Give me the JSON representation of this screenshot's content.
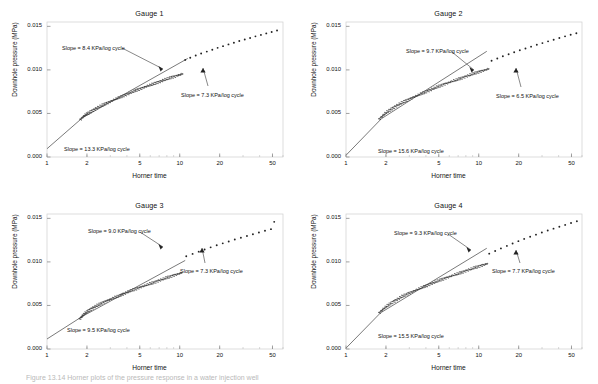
{
  "figure": {
    "caption": "Figure 13.14  Horner plots of the pressure response in a water injection well",
    "axis": {
      "xlabel": "Horner time",
      "ylabel": "Downhole pressure (MPa)",
      "xticks": [
        "1",
        "2",
        "5",
        "10",
        "20",
        "50"
      ],
      "yticks": [
        "0.000",
        "0.005",
        "0.010",
        "0.015"
      ]
    }
  },
  "chart_data": [
    {
      "type": "scatter",
      "title": "Gauge 1",
      "xlabel": "Horner time",
      "ylabel": "Downhole pressure (MPa)",
      "xscale": "log",
      "xlim": [
        1,
        60
      ],
      "ylim": [
        0.0,
        0.0155
      ],
      "xticks": [
        1,
        2,
        5,
        10,
        20,
        50
      ],
      "yticks": [
        0.0,
        0.005,
        0.01,
        0.015
      ],
      "grid": false,
      "legend": "none",
      "annotations": [
        {
          "label": "Slope = 8.4 KPa/log cycle",
          "slope_kpa_per_log_cycle": 8.4,
          "segment": "early-middle"
        },
        {
          "label": "Slope = 7.3 KPa/log cycle",
          "slope_kpa_per_log_cycle": 7.3,
          "segment": "late"
        },
        {
          "label": "Slope = 13.3 KPa/log cycle",
          "slope_kpa_per_log_cycle": 13.3,
          "segment": "earliest"
        }
      ],
      "fit_lines": [
        {
          "name": "early",
          "slope_kpa": 13.3,
          "x": [
            1.0,
            1.85
          ],
          "y": [
            0.00095,
            0.0045
          ]
        },
        {
          "name": "middle",
          "slope_kpa": 8.4,
          "x": [
            1.85,
            11.0
          ],
          "y": [
            0.0045,
            0.01115
          ]
        },
        {
          "name": "late",
          "slope_kpa": 7.3,
          "x": [
            11.0,
            58.0
          ],
          "y": [
            0.01115,
            0.01545
          ]
        }
      ],
      "points": {
        "dense_from": 1.8,
        "dense_to": 10.5,
        "sparse_from": 11.0,
        "sparse_to": 55.0,
        "x": [
          1.8,
          1.85,
          1.9,
          1.95,
          2.0,
          2.05,
          2.12,
          2.2,
          2.28,
          2.36,
          2.45,
          2.55,
          2.65,
          2.75,
          2.86,
          2.97,
          3.09,
          3.21,
          3.34,
          3.47,
          3.61,
          3.75,
          3.9,
          4.06,
          4.22,
          4.39,
          4.56,
          4.74,
          4.93,
          5.13,
          5.33,
          5.54,
          5.76,
          5.99,
          6.23,
          6.48,
          6.74,
          7.01,
          7.29,
          7.58,
          7.88,
          8.19,
          8.52,
          8.86,
          9.21,
          9.58,
          9.96,
          10.35,
          11.0,
          12.0,
          13.2,
          14.5,
          16.0,
          17.6,
          19.3,
          21.2,
          23.3,
          25.6,
          28.1,
          30.9,
          33.9,
          37.2,
          40.9,
          44.9,
          49.3,
          54.1
        ],
        "y": [
          0.00435,
          0.00455,
          0.0047,
          0.00485,
          0.00495,
          0.00505,
          0.0052,
          0.00535,
          0.00548,
          0.0056,
          0.00572,
          0.00585,
          0.00598,
          0.0061,
          0.00622,
          0.00634,
          0.00646,
          0.00658,
          0.0067,
          0.00681,
          0.00692,
          0.00703,
          0.00714,
          0.00725,
          0.00736,
          0.00746,
          0.00757,
          0.00767,
          0.00777,
          0.00787,
          0.00797,
          0.00807,
          0.00817,
          0.00826,
          0.00836,
          0.00845,
          0.00855,
          0.00864,
          0.00873,
          0.00882,
          0.00891,
          0.009,
          0.00909,
          0.00918,
          0.00926,
          0.00935,
          0.00943,
          0.00952,
          0.01115,
          0.0114,
          0.01165,
          0.01188,
          0.0121,
          0.01232,
          0.01253,
          0.01273,
          0.01293,
          0.01312,
          0.01331,
          0.01349,
          0.01367,
          0.01385,
          0.01402,
          0.01419,
          0.01436,
          0.01452
        ]
      }
    },
    {
      "type": "scatter",
      "title": "Gauge 2",
      "xlabel": "Horner time",
      "ylabel": "Downhole pressure (MPa)",
      "xscale": "log",
      "xlim": [
        1,
        60
      ],
      "ylim": [
        0.0,
        0.0155
      ],
      "xticks": [
        1,
        2,
        5,
        10,
        20,
        50
      ],
      "yticks": [
        0.0,
        0.005,
        0.01,
        0.015
      ],
      "grid": false,
      "legend": "none",
      "annotations": [
        {
          "label": "Slope = 9.7 KPa/log cycle",
          "slope_kpa_per_log_cycle": 9.7,
          "segment": "early-middle"
        },
        {
          "label": "Slope = 6.5 KPa/log cycle",
          "slope_kpa_per_log_cycle": 6.5,
          "segment": "late"
        },
        {
          "label": "Slope = 15.6 KPa/log cycle",
          "slope_kpa_per_log_cycle": 15.6,
          "segment": "earliest"
        }
      ],
      "fit_lines": [
        {
          "name": "early",
          "slope_kpa": 15.6,
          "x": [
            1.0,
            1.85
          ],
          "y": [
            0.0002,
            0.0044
          ]
        },
        {
          "name": "middle",
          "slope_kpa": 9.7,
          "x": [
            1.85,
            10.5
          ],
          "y": [
            0.0044,
            0.01175
          ]
        },
        {
          "name": "late",
          "slope_kpa": 6.5,
          "x": [
            10.5,
            58.0
          ],
          "y": [
            0.0108,
            0.0151
          ]
        }
      ],
      "points": {
        "dense_from": 1.8,
        "dense_to": 12.0,
        "sparse_from": 12.5,
        "sparse_to": 55.0,
        "x": [
          1.8,
          1.86,
          1.92,
          1.98,
          2.05,
          2.12,
          2.2,
          2.28,
          2.37,
          2.46,
          2.56,
          2.66,
          2.77,
          2.88,
          3.0,
          3.12,
          3.25,
          3.38,
          3.52,
          3.67,
          3.82,
          3.98,
          4.15,
          4.32,
          4.5,
          4.69,
          4.89,
          5.09,
          5.31,
          5.53,
          5.77,
          6.01,
          6.27,
          6.53,
          6.81,
          7.1,
          7.4,
          7.72,
          8.05,
          8.39,
          8.75,
          9.12,
          9.51,
          9.92,
          10.34,
          10.78,
          11.24,
          11.72,
          12.5,
          13.8,
          15.2,
          16.8,
          18.5,
          20.4,
          22.5,
          24.8,
          27.4,
          30.2,
          33.3,
          36.7,
          40.5,
          44.7,
          49.3,
          54.4
        ],
        "y": [
          0.0044,
          0.00462,
          0.00483,
          0.00502,
          0.0052,
          0.00537,
          0.00553,
          0.00568,
          0.00583,
          0.00597,
          0.00611,
          0.00625,
          0.00638,
          0.00651,
          0.00664,
          0.00677,
          0.00689,
          0.00701,
          0.00713,
          0.00725,
          0.00737,
          0.00748,
          0.0076,
          0.00771,
          0.00782,
          0.00793,
          0.00804,
          0.00815,
          0.00826,
          0.00836,
          0.00847,
          0.00857,
          0.00867,
          0.00877,
          0.00887,
          0.00897,
          0.00907,
          0.00917,
          0.00927,
          0.00936,
          0.00946,
          0.00955,
          0.00965,
          0.00974,
          0.00983,
          0.00992,
          0.01001,
          0.0101,
          0.01105,
          0.01131,
          0.01156,
          0.0118,
          0.01203,
          0.01225,
          0.01246,
          0.01267,
          0.01288,
          0.01308,
          0.01328,
          0.01347,
          0.01366,
          0.01385,
          0.01403,
          0.01421
        ]
      }
    },
    {
      "type": "scatter",
      "title": "Gauge 3",
      "xlabel": "Horner time",
      "ylabel": "Downhole pressure (MPa)",
      "xscale": "log",
      "xlim": [
        1,
        60
      ],
      "ylim": [
        0.0,
        0.0155
      ],
      "xticks": [
        1,
        2,
        5,
        10,
        20,
        50
      ],
      "yticks": [
        0.0,
        0.005,
        0.01,
        0.015
      ],
      "grid": false,
      "legend": "none",
      "annotations": [
        {
          "label": "Slope = 9.0 KPa/log cycle",
          "slope_kpa_per_log_cycle": 9.0,
          "segment": "early-middle"
        },
        {
          "label": "Slope = 7.3 KPa/log cycle",
          "slope_kpa_per_log_cycle": 7.3,
          "segment": "late"
        },
        {
          "label": "Slope = 9.5 KPa/log cycle",
          "slope_kpa_per_log_cycle": 9.5,
          "segment": "earliest"
        }
      ],
      "fit_lines": [
        {
          "name": "early",
          "slope_kpa": 9.5,
          "x": [
            1.0,
            1.85
          ],
          "y": [
            0.00115,
            0.00375
          ]
        },
        {
          "name": "middle",
          "slope_kpa": 9.0,
          "x": [
            1.85,
            10.5
          ],
          "y": [
            0.00375,
            0.01
          ]
        },
        {
          "name": "late",
          "slope_kpa": 7.3,
          "x": [
            10.5,
            58.0
          ],
          "y": [
            0.01035,
            0.0152
          ]
        }
      ],
      "points": {
        "dense_from": 1.8,
        "dense_to": 10.5,
        "sparse_from": 11.0,
        "sparse_to": 52.0,
        "x": [
          1.78,
          1.82,
          1.86,
          1.9,
          1.95,
          2.0,
          2.06,
          2.12,
          2.19,
          2.26,
          2.34,
          2.42,
          2.51,
          2.6,
          2.7,
          2.8,
          2.91,
          3.02,
          3.14,
          3.27,
          3.4,
          3.54,
          3.68,
          3.83,
          3.99,
          4.15,
          4.32,
          4.5,
          4.69,
          4.88,
          5.08,
          5.29,
          5.51,
          5.74,
          5.98,
          6.23,
          6.49,
          6.76,
          7.04,
          7.33,
          7.64,
          7.96,
          8.29,
          8.64,
          9.0,
          9.38,
          9.77,
          10.18,
          11.2,
          12.5,
          13.9,
          15.4,
          17.1,
          19.0,
          21.1,
          23.4,
          26.0,
          28.9,
          32.1,
          35.6,
          39.5,
          43.9,
          48.7,
          51.5
        ],
        "y": [
          0.0035,
          0.00368,
          0.00385,
          0.004,
          0.00415,
          0.00428,
          0.00442,
          0.00455,
          0.00468,
          0.0048,
          0.00492,
          0.00504,
          0.00516,
          0.00528,
          0.00539,
          0.00551,
          0.00562,
          0.00573,
          0.00584,
          0.00595,
          0.00606,
          0.00617,
          0.00628,
          0.00638,
          0.00649,
          0.00659,
          0.0067,
          0.0068,
          0.0069,
          0.007,
          0.0071,
          0.0072,
          0.0073,
          0.0074,
          0.0075,
          0.00759,
          0.00769,
          0.00779,
          0.00788,
          0.00798,
          0.00807,
          0.00817,
          0.00826,
          0.00835,
          0.00845,
          0.00854,
          0.00863,
          0.00872,
          0.01065,
          0.01092,
          0.01118,
          0.01143,
          0.01167,
          0.01191,
          0.01213,
          0.01235,
          0.01257,
          0.01278,
          0.01298,
          0.01318,
          0.01338,
          0.01357,
          0.01376,
          0.0146
        ]
      }
    },
    {
      "type": "scatter",
      "title": "Gauge 4",
      "xlabel": "Horner time",
      "ylabel": "Downhole pressure (MPa)",
      "xscale": "log",
      "xlim": [
        1,
        60
      ],
      "ylim": [
        0.0,
        0.0155
      ],
      "xticks": [
        1,
        2,
        5,
        10,
        20,
        50
      ],
      "yticks": [
        0.0,
        0.005,
        0.01,
        0.015
      ],
      "grid": false,
      "legend": "none",
      "annotations": [
        {
          "label": "Slope = 9.3 KPa/log cycle",
          "slope_kpa_per_log_cycle": 9.3,
          "segment": "early-middle"
        },
        {
          "label": "Slope = 7.7 KPa/log cycle",
          "slope_kpa_per_log_cycle": 7.7,
          "segment": "late"
        },
        {
          "label": "Slope = 15.5 KPa/log cycle",
          "slope_kpa_per_log_cycle": 15.5,
          "segment": "earliest"
        }
      ],
      "fit_lines": [
        {
          "name": "early",
          "slope_kpa": 15.5,
          "x": [
            1.0,
            1.82
          ],
          "y": [
            0.0001,
            0.00415
          ]
        },
        {
          "name": "middle",
          "slope_kpa": 9.3,
          "x": [
            1.82,
            10.5
          ],
          "y": [
            0.00415,
            0.0112
          ]
        },
        {
          "name": "late",
          "slope_kpa": 7.7,
          "x": [
            10.5,
            58.0
          ],
          "y": [
            0.01075,
            0.01545
          ]
        }
      ],
      "points": {
        "dense_from": 1.8,
        "dense_to": 11.5,
        "sparse_from": 12.0,
        "sparse_to": 55.0,
        "x": [
          1.8,
          1.86,
          1.92,
          1.99,
          2.06,
          2.13,
          2.21,
          2.3,
          2.39,
          2.48,
          2.58,
          2.68,
          2.79,
          2.91,
          3.03,
          3.15,
          3.28,
          3.42,
          3.56,
          3.71,
          3.87,
          4.03,
          4.2,
          4.38,
          4.56,
          4.76,
          4.96,
          5.17,
          5.39,
          5.62,
          5.86,
          6.11,
          6.37,
          6.64,
          6.92,
          7.22,
          7.53,
          7.85,
          8.19,
          8.54,
          8.91,
          9.29,
          9.69,
          10.1,
          10.53,
          10.98,
          11.45,
          12.0,
          13.3,
          14.7,
          16.3,
          18.0,
          19.9,
          22.0,
          24.4,
          27.0,
          29.9,
          33.1,
          36.6,
          40.5,
          44.8,
          49.6,
          54.9
        ],
        "y": [
          0.0042,
          0.00442,
          0.00463,
          0.00482,
          0.005,
          0.00517,
          0.00533,
          0.00549,
          0.00564,
          0.00578,
          0.00592,
          0.00606,
          0.00619,
          0.00632,
          0.00645,
          0.00657,
          0.00669,
          0.00681,
          0.00693,
          0.00705,
          0.00716,
          0.00727,
          0.00739,
          0.0075,
          0.00761,
          0.00771,
          0.00782,
          0.00793,
          0.00803,
          0.00814,
          0.00824,
          0.00834,
          0.00844,
          0.00854,
          0.00864,
          0.00874,
          0.00884,
          0.00894,
          0.00903,
          0.00913,
          0.00922,
          0.00932,
          0.00941,
          0.0095,
          0.00959,
          0.00968,
          0.00977,
          0.01095,
          0.01125,
          0.01155,
          0.01184,
          0.01212,
          0.01238,
          0.01264,
          0.01289,
          0.01313,
          0.01337,
          0.0136,
          0.01382,
          0.01404,
          0.01425,
          0.01446,
          0.01467
        ]
      }
    }
  ]
}
